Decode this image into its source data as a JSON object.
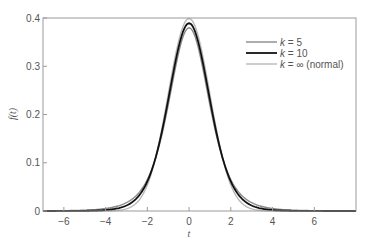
{
  "chart_data": {
    "type": "line",
    "title": "",
    "xlabel": "t",
    "ylabel": "f(t)",
    "xlim": [
      -7,
      8
    ],
    "ylim": [
      0,
      0.4
    ],
    "xticks": [
      -6,
      -4,
      -2,
      0,
      2,
      4,
      6
    ],
    "xtick_labels": [
      "−6",
      "−4",
      "−2",
      "0",
      "2",
      "4",
      "6"
    ],
    "yticks": [
      0,
      0.1,
      0.2,
      0.3,
      0.4
    ],
    "ytick_labels": [
      "0",
      "0.1",
      "0.2",
      "0.3",
      "0.4"
    ],
    "grid": false,
    "legend_position": "upper right",
    "series": [
      {
        "name": "k = 5",
        "label_k": "k",
        "label_rest": " = 5",
        "dist": "t",
        "df": 5,
        "color": "#8a8a8a",
        "width": 1.4,
        "peak": 0.38
      },
      {
        "name": "k = 10",
        "label_k": "k",
        "label_rest": " = 10",
        "dist": "t",
        "df": 10,
        "color": "#111111",
        "width": 1.8,
        "peak": 0.389
      },
      {
        "name": "k = ∞ (normal)",
        "label_k": "k",
        "label_rest": " = ∞ (normal)",
        "dist": "normal",
        "df": null,
        "color": "#b8b8b8",
        "width": 1.4,
        "peak": 0.399
      }
    ]
  }
}
